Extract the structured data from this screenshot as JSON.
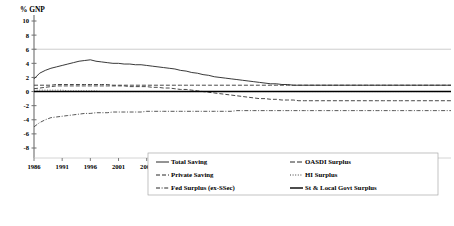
{
  "chart_data": {
    "type": "line",
    "title": "",
    "ylabel": "% GNP",
    "xlabel": "Year",
    "ylim": [
      -8,
      10
    ],
    "xlim": [
      1986,
      2060
    ],
    "ytick_values": [
      -8,
      -6,
      -4,
      -2,
      0,
      2,
      4,
      6,
      8,
      10
    ],
    "ytick_labels": [
      "-8",
      "-6",
      "-4",
      "-2",
      "0",
      "2",
      "4",
      "6",
      "8",
      "10"
    ],
    "xtick_values": [
      1986,
      1991,
      1996,
      2001,
      2006,
      2011,
      2016,
      2021,
      2026,
      2031,
      2036,
      2041,
      2046,
      2051,
      2056
    ],
    "xtick_labels": [
      "1986",
      "1991",
      "1996",
      "2001",
      "2006",
      "2011",
      "2016",
      "2021",
      "2026",
      "2031",
      "2036",
      "2041",
      "2046",
      "2051",
      "2056"
    ],
    "grid": "horizontal-top-only",
    "gridline_values": [
      6
    ],
    "legend_position": "bottom-center",
    "x": [
      1986,
      1987,
      1988,
      1989,
      1990,
      1991,
      1992,
      1993,
      1994,
      1995,
      1996,
      1997,
      1998,
      1999,
      2000,
      2001,
      2002,
      2003,
      2004,
      2005,
      2006,
      2007,
      2008,
      2009,
      2010,
      2011,
      2012,
      2013,
      2014,
      2015,
      2016,
      2017,
      2018,
      2019,
      2020,
      2021,
      2022,
      2023,
      2024,
      2025,
      2026,
      2027,
      2028,
      2029,
      2030,
      2031,
      2032,
      2033,
      2034,
      2035,
      2036,
      2037,
      2038,
      2039,
      2040,
      2041,
      2042,
      2043,
      2044,
      2045,
      2046,
      2047,
      2048,
      2049,
      2050,
      2051,
      2052,
      2053,
      2054,
      2055,
      2056,
      2057,
      2058,
      2059,
      2060
    ],
    "series": [
      {
        "name": "Total Saving",
        "style": "solid",
        "color": "#222222",
        "values": [
          1.8,
          2.6,
          3.0,
          3.3,
          3.5,
          3.7,
          3.9,
          4.1,
          4.3,
          4.4,
          4.5,
          4.3,
          4.2,
          4.1,
          4.0,
          4.0,
          3.9,
          3.9,
          3.8,
          3.8,
          3.7,
          3.6,
          3.5,
          3.4,
          3.3,
          3.2,
          3.0,
          2.9,
          2.7,
          2.6,
          2.4,
          2.3,
          2.1,
          2.0,
          1.9,
          1.8,
          1.7,
          1.6,
          1.5,
          1.4,
          1.3,
          1.2,
          1.1,
          1.1,
          1.0,
          1.0,
          0.9,
          0.9,
          0.9,
          0.9,
          0.9,
          0.9,
          0.9,
          0.9,
          0.9,
          0.9,
          0.9,
          0.9,
          0.9,
          0.9,
          0.9,
          0.9,
          0.9,
          0.9,
          0.9,
          0.9,
          0.9,
          0.9,
          0.9,
          0.9,
          0.9,
          0.9,
          0.9,
          0.9,
          0.9
        ]
      },
      {
        "name": "Private Saving",
        "style": "dash",
        "color": "#333333",
        "values": [
          0.9,
          0.9,
          0.9,
          0.9,
          1.0,
          1.0,
          1.0,
          1.0,
          1.0,
          1.0,
          1.0,
          1.0,
          1.0,
          1.0,
          0.9,
          0.9,
          0.9,
          0.9,
          0.9,
          0.9,
          0.9,
          0.9,
          0.9,
          0.9,
          0.9,
          0.9,
          0.9,
          0.9,
          0.9,
          0.9,
          0.9,
          0.9,
          0.9,
          0.9,
          0.9,
          0.9,
          0.9,
          0.9,
          0.9,
          0.9,
          0.9,
          0.9,
          0.9,
          0.9,
          0.9,
          0.9,
          0.9,
          0.9,
          0.9,
          0.9,
          0.9,
          0.9,
          0.9,
          0.9,
          0.9,
          0.9,
          0.9,
          0.9,
          0.9,
          0.9,
          0.9,
          0.9,
          0.9,
          0.9,
          0.9,
          0.9,
          0.9,
          0.9,
          0.9,
          0.9,
          0.9,
          0.9,
          0.9,
          0.9,
          0.9
        ]
      },
      {
        "name": "Fed Surplus (ex-SSec)",
        "style": "dashdot",
        "color": "#444444",
        "values": [
          -5.0,
          -4.4,
          -4.0,
          -3.7,
          -3.6,
          -3.5,
          -3.4,
          -3.3,
          -3.2,
          -3.1,
          -3.1,
          -3.0,
          -3.0,
          -3.0,
          -2.9,
          -2.9,
          -2.9,
          -2.9,
          -2.9,
          -2.9,
          -2.8,
          -2.8,
          -2.8,
          -2.8,
          -2.8,
          -2.8,
          -2.8,
          -2.8,
          -2.8,
          -2.8,
          -2.8,
          -2.8,
          -2.8,
          -2.8,
          -2.8,
          -2.8,
          -2.7,
          -2.7,
          -2.7,
          -2.7,
          -2.7,
          -2.7,
          -2.7,
          -2.7,
          -2.7,
          -2.7,
          -2.7,
          -2.7,
          -2.7,
          -2.7,
          -2.7,
          -2.7,
          -2.7,
          -2.7,
          -2.7,
          -2.7,
          -2.7,
          -2.7,
          -2.7,
          -2.7,
          -2.7,
          -2.7,
          -2.7,
          -2.7,
          -2.7,
          -2.7,
          -2.7,
          -2.7,
          -2.7,
          -2.7,
          -2.7,
          -2.7,
          -2.7,
          -2.7,
          -2.7
        ]
      },
      {
        "name": "OASDI Surplus",
        "style": "dash",
        "color": "#333333",
        "values": [
          0.4,
          0.5,
          0.6,
          0.7,
          0.8,
          0.8,
          0.8,
          0.8,
          0.8,
          0.8,
          0.8,
          0.8,
          0.8,
          0.8,
          0.8,
          0.8,
          0.8,
          0.7,
          0.7,
          0.7,
          0.7,
          0.6,
          0.6,
          0.5,
          0.5,
          0.4,
          0.3,
          0.3,
          0.2,
          0.1,
          0.0,
          -0.1,
          -0.2,
          -0.3,
          -0.4,
          -0.5,
          -0.6,
          -0.7,
          -0.8,
          -0.9,
          -1.0,
          -1.0,
          -1.1,
          -1.1,
          -1.2,
          -1.2,
          -1.2,
          -1.3,
          -1.3,
          -1.3,
          -1.3,
          -1.3,
          -1.3,
          -1.3,
          -1.3,
          -1.3,
          -1.3,
          -1.3,
          -1.3,
          -1.3,
          -1.3,
          -1.3,
          -1.3,
          -1.3,
          -1.3,
          -1.3,
          -1.3,
          -1.3,
          -1.3,
          -1.3,
          -1.3,
          -1.3,
          -1.3,
          -1.3,
          -1.3
        ]
      },
      {
        "name": "HI Surplus",
        "style": "dot",
        "color": "#555555",
        "values": [
          0.2,
          0.2,
          0.2,
          0.2,
          0.2,
          0.2,
          0.1,
          0.1,
          0.1,
          0.1,
          0.1,
          0.1,
          0.0,
          0.0,
          0.0,
          0.0,
          0.0,
          0.0,
          0.0,
          0.0,
          0.0,
          0.0,
          0.0,
          0.0,
          0.0,
          0.0,
          0.0,
          0.0,
          0.0,
          0.0,
          0.0,
          0.0,
          0.0,
          0.0,
          0.0,
          0.0,
          0.0,
          0.0,
          0.0,
          0.0,
          0.0,
          0.0,
          0.0,
          0.0,
          0.0,
          0.0,
          0.0,
          0.0,
          0.0,
          0.0,
          0.0,
          0.0,
          0.0,
          0.0,
          0.0,
          0.0,
          0.0,
          0.0,
          0.0,
          0.0,
          0.0,
          0.0,
          0.0,
          0.0,
          0.0,
          0.0,
          0.0,
          0.0,
          0.0,
          0.0,
          0.0,
          0.0,
          0.0,
          0.0,
          0.0
        ]
      },
      {
        "name": "St & Local Govt Surplus",
        "style": "solid-thick",
        "color": "#000000",
        "values": [
          0.0,
          0.0,
          0.0,
          0.0,
          0.0,
          0.0,
          0.0,
          0.0,
          0.0,
          0.0,
          0.0,
          0.0,
          0.0,
          0.0,
          0.0,
          0.0,
          0.0,
          0.0,
          0.0,
          0.0,
          0.0,
          0.0,
          0.0,
          0.0,
          0.0,
          0.0,
          0.0,
          0.0,
          0.0,
          0.0,
          0.0,
          0.0,
          0.0,
          0.0,
          0.0,
          0.0,
          0.0,
          0.0,
          0.0,
          0.0,
          0.0,
          0.0,
          0.0,
          0.0,
          0.0,
          0.0,
          0.0,
          0.0,
          0.0,
          0.0,
          0.0,
          0.0,
          0.0,
          0.0,
          0.0,
          0.0,
          0.0,
          0.0,
          0.0,
          0.0,
          0.0,
          0.0,
          0.0,
          0.0,
          0.0,
          0.0,
          0.0,
          0.0,
          0.0,
          0.0,
          0.0,
          0.0,
          0.0,
          0.0,
          0.0
        ]
      }
    ],
    "legend": [
      {
        "label": "Total Saving",
        "style": "solid",
        "column": 0
      },
      {
        "label": "Private Saving",
        "style": "dash",
        "column": 0
      },
      {
        "label": "Fed Surplus (ex-SSec)",
        "style": "dashdot",
        "column": 0
      },
      {
        "label": "OASDI Surplus",
        "style": "dash-long",
        "column": 1
      },
      {
        "label": "HI Surplus",
        "style": "dot",
        "column": 1
      },
      {
        "label": "St & Local Govt Surplus",
        "style": "solid-thick",
        "column": 1
      }
    ]
  }
}
